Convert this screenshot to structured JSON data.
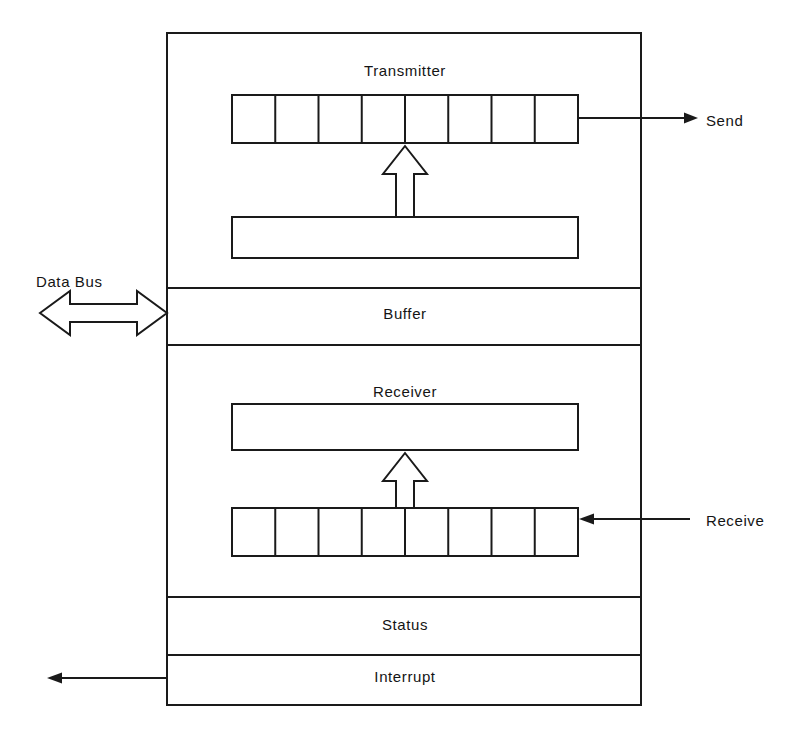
{
  "diagram": {
    "background_color": "#ffffff",
    "line_color": "#1a1a1a",
    "outer_block": {
      "x": 167,
      "y": 33,
      "width": 474,
      "height": 672
    },
    "sections": [
      {
        "name": "transmitter",
        "label": "Transmitter",
        "label_x": 405,
        "label_y": 62,
        "band_top": 33,
        "band_bottom": 288
      },
      {
        "name": "buffer",
        "label": "Buffer",
        "label_x": 405,
        "label_y": 305,
        "band_top": 288,
        "band_bottom": 345
      },
      {
        "name": "receiver",
        "label": "Receiver",
        "label_x": 405,
        "label_y": 383,
        "band_top": 345,
        "band_bottom": 597
      },
      {
        "name": "status",
        "label": "Status",
        "label_x": 405,
        "label_y": 616,
        "band_top": 597,
        "band_bottom": 655
      },
      {
        "name": "interrupt",
        "label": "Interrupt",
        "label_x": 405,
        "label_y": 668,
        "band_top": 655,
        "band_bottom": 705
      }
    ],
    "side_labels": [
      {
        "name": "data-bus",
        "text": "Data Bus",
        "x": 36,
        "y": 273
      },
      {
        "name": "send",
        "text": "Send",
        "x": 706,
        "y": 112
      },
      {
        "name": "receive",
        "text": "Receive",
        "x": 706,
        "y": 512
      }
    ],
    "shift_registers": [
      {
        "name": "transmitter-shift-register",
        "x": 232,
        "y": 95,
        "width": 346,
        "height": 48,
        "cells": 8
      },
      {
        "name": "receiver-shift-register",
        "x": 232,
        "y": 508,
        "width": 346,
        "height": 48,
        "cells": 8
      }
    ],
    "holding_registers": [
      {
        "name": "transmitter-holding-register",
        "x": 232,
        "y": 217,
        "width": 346,
        "height": 41
      },
      {
        "name": "receiver-holding-register",
        "x": 232,
        "y": 404,
        "width": 346,
        "height": 46
      }
    ],
    "hollow_arrows": [
      {
        "name": "transmitter-data-path-arrow",
        "direction": "up",
        "cx": 405,
        "tip_y": 146,
        "tail_y": 217
      },
      {
        "name": "receiver-data-path-arrow",
        "direction": "up",
        "cx": 405,
        "tip_y": 453,
        "tail_y": 508
      }
    ],
    "line_arrows": [
      {
        "name": "send-arrow",
        "direction": "right",
        "x1": 578,
        "x2": 684,
        "y": 118
      },
      {
        "name": "receive-arrow",
        "direction": "left",
        "x1": 690,
        "x2": 580,
        "y": 519
      },
      {
        "name": "interrupt-arrow",
        "direction": "left",
        "x1": 167,
        "x2": 47,
        "y": 678
      }
    ],
    "bidirectional_arrow": {
      "name": "data-bus-arrow",
      "x_left": 40,
      "x_right": 167,
      "cy": 313,
      "head_width": 30,
      "head_half_height": 22,
      "shaft_half_height": 9
    }
  }
}
